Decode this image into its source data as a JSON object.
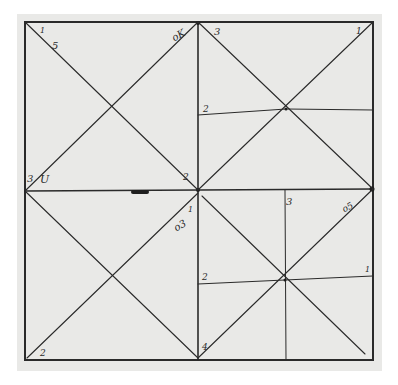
{
  "figure": {
    "colors": {
      "paper": "#e9e9e7",
      "ink": "#2a2a2a",
      "background": "#ffffff"
    }
  },
  "quadrants": {
    "top_left": {
      "labels": {
        "top_left": "1",
        "diag_upper": "5",
        "top_right": "oK",
        "bottom_left_a": "3",
        "bottom_left_b": "U",
        "bottom_right": "2"
      }
    },
    "top_right": {
      "labels": {
        "top_left": "3",
        "top_right": "1",
        "left_mid": "2"
      }
    },
    "bottom_left": {
      "labels": {
        "bottom_left": "2",
        "top_right_a": "o3",
        "top_right_b": "1"
      }
    },
    "bottom_right": {
      "labels": {
        "top_mid": "3",
        "top_right": "o5",
        "right_mid": "1",
        "left_mid": "2",
        "bottom_left": "4"
      }
    }
  }
}
